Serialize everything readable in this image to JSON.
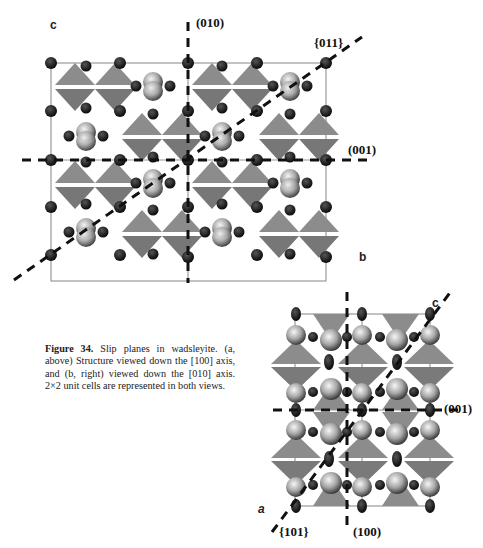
{
  "figure": {
    "number": "Figure 34.",
    "caption": "Slip planes in wadsleyite. (a, above) Structure viewed down the [100] axis, and (b, right) viewed down the [010] axis. 2×2 unit cells are represented in both views."
  },
  "panel_a": {
    "view_axis": "[100]",
    "axis_labels": {
      "vertical": "c",
      "horizontal": "b"
    },
    "plane_labels": {
      "vertical": "(010)",
      "diagonal": "{011}",
      "horizontal": "(001)"
    }
  },
  "panel_b": {
    "view_axis": "[010]",
    "axis_labels": {
      "vertical": "c",
      "horizontal": "a"
    },
    "plane_labels": {
      "horizontal": "(001)",
      "diagonal": "{101}",
      "vertical": "(100)"
    }
  },
  "colors": {
    "tetrahedra": "#8a8a8a",
    "atoms_dark": "#1a1a1a",
    "atoms_large": "#b8b8b8",
    "cell_edge": "#9a9a9a",
    "dash_lines": "#111111"
  }
}
